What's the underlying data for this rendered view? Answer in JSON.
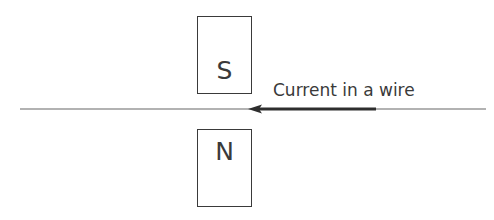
{
  "diagram": {
    "magnets": [
      {
        "pole": "S",
        "position": "above wire"
      },
      {
        "pole": "N",
        "position": "below wire"
      }
    ],
    "wire": {
      "label": "Current in a wire",
      "current_direction": "left"
    },
    "colors": {
      "stroke": "#3a3a3a",
      "wire": "#555555",
      "background": "#ffffff"
    }
  }
}
